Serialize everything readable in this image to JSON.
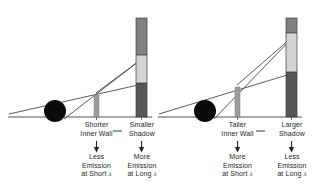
{
  "figure": {
    "panels": [
      {
        "id": "left-panel",
        "inner_wall": {
          "label_line1": "Shorter",
          "label_line2": "Inner Wall",
          "height_px": 22,
          "color": "#9b9b9b"
        },
        "shadow_bar": {
          "label_line1": "Smaller",
          "label_line2": "Shadow",
          "color_top": "#808080",
          "color_middle": "#d4d4d4",
          "color_bottom": "#565656",
          "shadow_fraction": 0.29
        },
        "consequence_left": {
          "line1": "Less",
          "line2": "Emission",
          "line3": "at Short",
          "symbol": "λ"
        },
        "consequence_right": {
          "line1": "More",
          "line2": "Emission",
          "line3": "at Long",
          "symbol": "λ"
        }
      },
      {
        "id": "right-panel",
        "inner_wall": {
          "label_line1": "Taller",
          "label_line2": "Inner Wall",
          "height_px": 30,
          "color": "#9b9b9b"
        },
        "shadow_bar": {
          "label_line1": "Larger",
          "label_line2": "Shadow",
          "color_top": "#808080",
          "color_middle": "#d4d4d4",
          "color_bottom": "#565656",
          "shadow_fraction": 0.39
        },
        "consequence_left": {
          "line1": "More",
          "line2": "Emission",
          "line3": "at Short",
          "symbol": "λ"
        },
        "consequence_right": {
          "line1": "Less",
          "line2": "Emission",
          "line3": "at Long",
          "symbol": "λ"
        }
      }
    ],
    "colors": {
      "baseline": "#555555",
      "ray": "#4a4a4a",
      "sphere": "#0a0a0a",
      "text": "#262626",
      "bar_top": "#808080",
      "bar_light": "#d4d4d4",
      "bar_dark": "#565656",
      "wall": "#9b9b9b",
      "background": "#ffffff"
    },
    "geometry": {
      "baseline_y": 117,
      "left": {
        "axis_x0": 8,
        "sphere_cx": 55,
        "sphere_cy": 111,
        "sphere_r": 11,
        "wall_x": 94,
        "wall_w": 5,
        "wall_top_y": 95,
        "bar_x": 136,
        "bar_w": 11,
        "bar_top_y": 18,
        "bar_light_top_y": 55,
        "bar_dark_top_y": 83
      },
      "right": {
        "axis_x0": 158,
        "sphere_cx": 205,
        "sphere_cy": 111,
        "sphere_r": 11,
        "wall_x": 235,
        "wall_w": 5,
        "wall_top_y": 87,
        "bar_x": 286,
        "bar_w": 11,
        "bar_top_y": 18,
        "bar_light_top_y": 33,
        "bar_dark_top_y": 72
      }
    }
  }
}
